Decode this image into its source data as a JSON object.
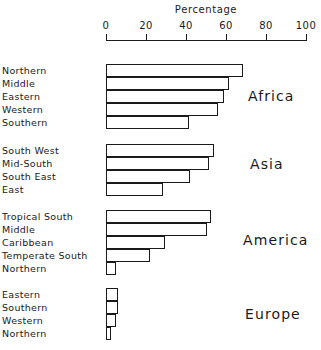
{
  "chart_data": {
    "type": "bar",
    "orientation": "horizontal",
    "title": "Percentage",
    "xlabel": "Percentage",
    "ylabel": "",
    "xlim": [
      0,
      100
    ],
    "xticks": [
      0,
      20,
      40,
      60,
      80,
      100
    ],
    "xtick_labels": [
      "0",
      "20",
      "40",
      "60",
      "80",
      "100"
    ],
    "grid": false,
    "legend": "none",
    "groups": [
      {
        "name": "Africa",
        "categories": [
          "Northern",
          "Middle",
          "Eastern",
          "Western",
          "Southern"
        ],
        "values": [
          68.5,
          61.5,
          59,
          56,
          41.5
        ]
      },
      {
        "name": "Asia",
        "categories": [
          "South West",
          "Mid-South",
          "South East",
          "East"
        ],
        "values": [
          54,
          51.5,
          42,
          28.5
        ]
      },
      {
        "name": "America",
        "categories": [
          "Tropical South",
          "Middle",
          "Caribbean",
          "Temperate South",
          "Northern"
        ],
        "values": [
          52.5,
          50.5,
          29.5,
          22,
          5
        ]
      },
      {
        "name": "Europe",
        "categories": [
          "Eastern",
          "Southern",
          "Western",
          "Northern"
        ],
        "values": [
          6,
          6,
          5,
          2.5
        ]
      }
    ]
  },
  "colors": {
    "ink": "#1a1a1a",
    "bar_fill": "#ffffff",
    "background": "#ffffff"
  }
}
